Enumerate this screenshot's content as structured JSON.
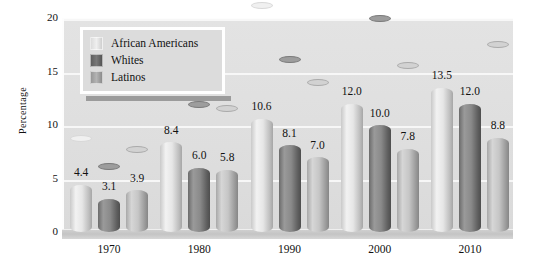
{
  "chart_data": {
    "type": "bar",
    "title": "",
    "xlabel": "",
    "ylabel": "Percentage",
    "categories": [
      "1970",
      "1980",
      "1990",
      "2000",
      "2010"
    ],
    "series": [
      {
        "name": "African Americans",
        "color": "#e6e6e6",
        "values": [
          4.4,
          8.4,
          10.6,
          12.0,
          13.5
        ]
      },
      {
        "name": "Whites",
        "color": "#6f6f6f",
        "values": [
          3.1,
          6.0,
          8.1,
          10.0,
          12.0
        ]
      },
      {
        "name": "Latinos",
        "color": "#b0b0b0",
        "values": [
          3.9,
          5.8,
          7.0,
          7.8,
          8.8
        ]
      }
    ],
    "ylim": [
      0,
      20
    ],
    "yticks": [
      "0",
      "5",
      "10",
      "15",
      "20"
    ],
    "grid": true,
    "legend_position": "top-left",
    "data_labels": [
      [
        "4.4",
        "3.1",
        "3.9"
      ],
      [
        "8.4",
        "6.0",
        "5.8"
      ],
      [
        "10.6",
        "8.1",
        "7.0"
      ],
      [
        "12.0",
        "10.0",
        "7.8"
      ],
      [
        "13.5",
        "12.0",
        "8.8"
      ]
    ]
  },
  "colors": {
    "plot_background": "#e0e0e0",
    "gridline": "#f7f7f7",
    "page_background": "#ffffff",
    "text": "#111111"
  }
}
